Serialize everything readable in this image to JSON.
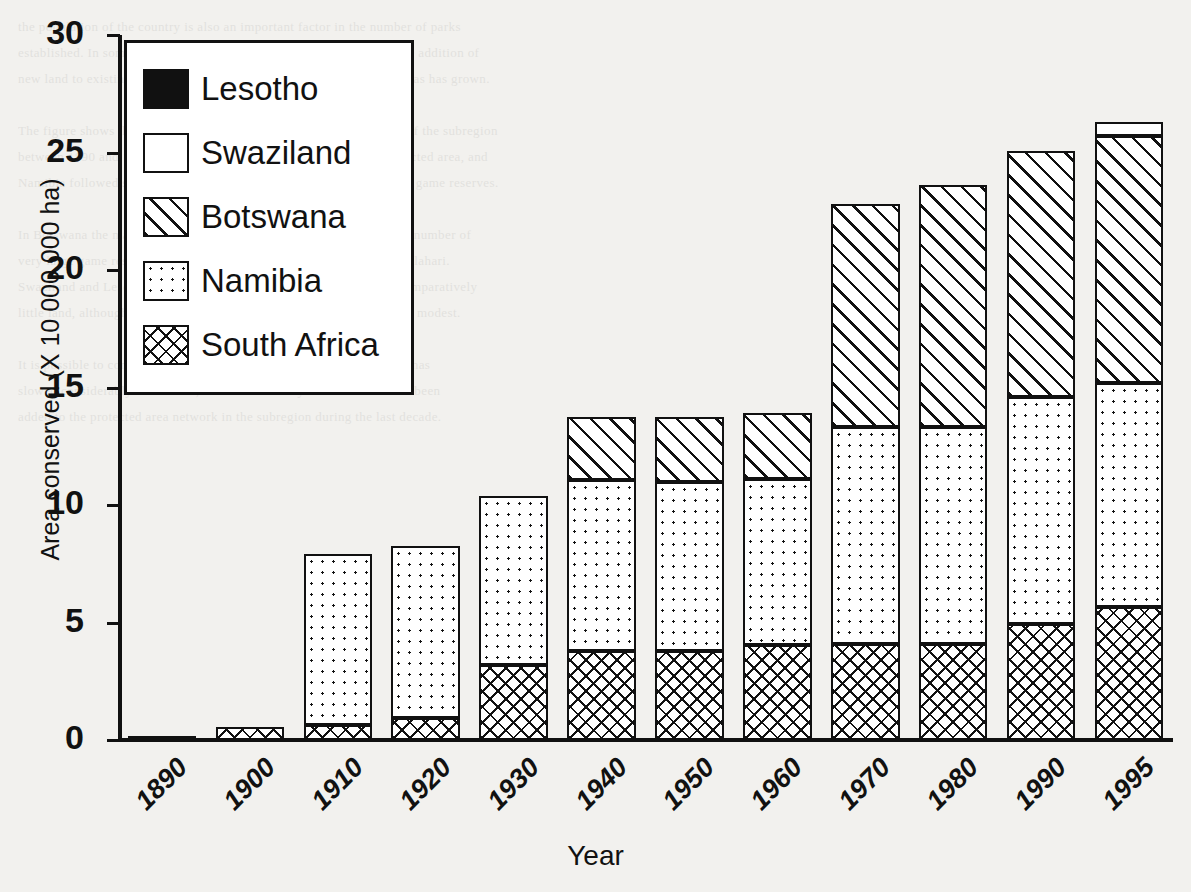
{
  "chart_data": {
    "type": "bar",
    "stacked": true,
    "title": "",
    "xlabel": "Year",
    "ylabel": "Area conserved (X 10 000 000 ha)",
    "categories": [
      "1890",
      "1900",
      "1910",
      "1920",
      "1930",
      "1940",
      "1950",
      "1960",
      "1970",
      "1980",
      "1990",
      "1995"
    ],
    "ylim": [
      0,
      30
    ],
    "yticks": [
      0,
      5,
      10,
      15,
      20,
      25,
      30
    ],
    "grid": false,
    "legend_position": "top-left",
    "series": [
      {
        "name": "South Africa",
        "fill": "cross-hatch",
        "values": [
          0.1,
          0.55,
          0.65,
          0.95,
          3.2,
          3.8,
          3.8,
          4.05,
          4.1,
          4.1,
          4.95,
          5.65
        ]
      },
      {
        "name": "Namibia",
        "fill": "dotted",
        "values": [
          0,
          0,
          7.9,
          8.25,
          10.4,
          11.05,
          11.0,
          11.1,
          13.3,
          13.3,
          14.6,
          15.2
        ]
      },
      {
        "name": "Botswana",
        "fill": "diagonal-hatch",
        "values": [
          0,
          0,
          0,
          0,
          0,
          13.75,
          13.75,
          13.9,
          22.8,
          23.6,
          25.05,
          25.7
        ]
      },
      {
        "name": "Swaziland",
        "fill": "white",
        "values": [
          0,
          0,
          0,
          0,
          0,
          0,
          0,
          0,
          0,
          0,
          0,
          26.3
        ]
      },
      {
        "name": "Lesotho",
        "fill": "solid-black",
        "values": [
          0,
          0,
          0,
          0,
          0,
          0,
          0,
          0,
          0,
          0,
          0,
          0
        ]
      }
    ],
    "cumulative_tops": {
      "1890": {
        "south_africa": 0.1
      },
      "1900": {
        "south_africa": 0.55
      },
      "1910": {
        "south_africa": 0.65,
        "namibia": 7.9
      },
      "1920": {
        "south_africa": 0.95,
        "namibia": 8.25
      },
      "1930": {
        "south_africa": 3.2,
        "namibia": 10.4
      },
      "1940": {
        "south_africa": 3.8,
        "namibia": 11.05,
        "botswana": 13.75
      },
      "1950": {
        "south_africa": 3.8,
        "namibia": 11.0,
        "botswana": 13.75
      },
      "1960": {
        "south_africa": 4.05,
        "namibia": 11.1,
        "botswana": 13.9
      },
      "1970": {
        "south_africa": 4.1,
        "namibia": 13.3,
        "botswana": 22.8
      },
      "1980": {
        "south_africa": 4.1,
        "namibia": 13.3,
        "botswana": 23.6
      },
      "1990": {
        "south_africa": 4.95,
        "namibia": 14.6,
        "botswana": 25.05
      },
      "1995": {
        "south_africa": 5.65,
        "namibia": 15.2,
        "botswana": 25.7,
        "swaziland": 26.3
      }
    }
  },
  "legend": {
    "items": [
      {
        "label": "Lesotho",
        "fill": "solid-black"
      },
      {
        "label": "Swaziland",
        "fill": "white"
      },
      {
        "label": "Botswana",
        "fill": "diagonal-hatch"
      },
      {
        "label": "Namibia",
        "fill": "dotted"
      },
      {
        "label": "South Africa",
        "fill": "cross-hatch"
      }
    ]
  },
  "colors": {
    "ink": "#111111",
    "paper": "#f2f1ee",
    "fill": "#ffffff"
  },
  "ghost_text": "the population of the country is also an important factor in the number of parks\nestablished. In some cases the area protected has been increased by the addition of\nnew land to existing parks, while in others the number of protected areas has grown.\n\nThe figure shows the cumulative area conserved in the five countries of the subregion\nbetween 1890 and 1995. South Africa was the first to proclaim a protected area, and\nNamibia followed soon afterwards with the proclamation of very large game reserves.\n\nIn Botswana the major expansion took place during the 1960s, when a number of\nvery large game reserves and national parks were established in the Kalahari.\nSwaziland and Lesotho, the two smallest countries, have conserved comparatively\nlittle land, although in proportion to their total area the figures are less modest.\n\nIt is possible to conclude that the rate of growth in the area conserved has\nslowed considerably since 1980, and that relatively little new land has been\nadded to the protected area network in the subregion during the last decade."
}
